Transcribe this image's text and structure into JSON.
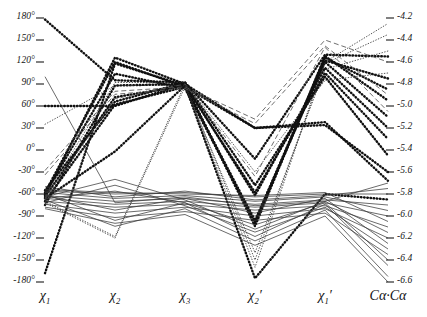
{
  "chart_data": {
    "type": "line",
    "subtype": "parallel-coordinates",
    "title": "",
    "xlabel": "",
    "ylabel": "",
    "grid": false,
    "legend": "none",
    "axes": [
      {
        "name": "chi1",
        "label": "χ",
        "sub": "1",
        "prime": false,
        "x": 45
      },
      {
        "name": "chi2",
        "label": "χ",
        "sub": "2",
        "prime": false,
        "x": 115
      },
      {
        "name": "chi3",
        "label": "χ",
        "sub": "3",
        "prime": false,
        "x": 185
      },
      {
        "name": "chi2p",
        "label": "χ",
        "sub": "2",
        "prime": true,
        "x": 255
      },
      {
        "name": "chi1p",
        "label": "χ",
        "sub": "1",
        "prime": true,
        "x": 325
      },
      {
        "name": "cacа",
        "label": "Cα·Cα",
        "sub": "",
        "prime": false,
        "x": 388
      }
    ],
    "left_axis": {
      "unit": "degrees",
      "min": -180,
      "max": 180,
      "step": 30,
      "ticks": [
        "180°",
        "150°",
        "120°",
        "90°",
        "60°",
        "30°",
        "0°",
        "-30°",
        "-60°",
        "-90°",
        "-120°",
        "-150°",
        "-180°"
      ],
      "tick_values": [
        180,
        150,
        120,
        90,
        60,
        30,
        0,
        -30,
        -60,
        -90,
        -120,
        -150,
        -180
      ]
    },
    "right_axis": {
      "unit": "angstrom",
      "min": -6.6,
      "max": -4.2,
      "step": 0.2,
      "ticks": [
        "-4.2",
        "-4.4",
        "-4.6",
        "-4.8",
        "-5.0",
        "-5.2",
        "-5.4",
        "-5.6",
        "-5.8",
        "-6.0",
        "-6.2",
        "-6.4",
        "-6.6"
      ],
      "tick_values": [
        -4.2,
        -4.4,
        -4.6,
        -4.8,
        -5.0,
        -5.2,
        -5.4,
        -5.6,
        -5.8,
        -6.0,
        -6.2,
        -6.4,
        -6.6
      ]
    },
    "xtick_labels": [
      "χ₁",
      "χ₂",
      "χ₃",
      "χ₂′",
      "χ₁′",
      "Cα·Cα"
    ],
    "styles": {
      "dotted": {
        "stroke": "#101010",
        "width": 2.4,
        "dash": "0.6,2.6",
        "cap": "round"
      },
      "solid": {
        "stroke": "#3a3a3a",
        "width": 0.75,
        "dash": "none",
        "cap": "butt"
      },
      "dashed": {
        "stroke": "#555555",
        "width": 0.85,
        "dash": "5,3",
        "cap": "butt"
      },
      "fine": {
        "stroke": "#2a2a2a",
        "width": 0.8,
        "dash": "0.6,2.2",
        "cap": "round"
      }
    },
    "series": [
      {
        "name": "d1",
        "style": "dotted",
        "values": [
          178,
          95,
          92,
          -12,
          130,
          -4.55
        ]
      },
      {
        "name": "d2",
        "style": "dotted",
        "values": [
          -168,
          118,
          88,
          -100,
          122,
          -4.75
        ]
      },
      {
        "name": "d3",
        "style": "dotted",
        "values": [
          -62,
          126,
          90,
          -104,
          128,
          -4.95
        ]
      },
      {
        "name": "d4",
        "style": "dotted",
        "values": [
          -58,
          120,
          86,
          -96,
          120,
          -5.1
        ]
      },
      {
        "name": "d5",
        "style": "dotted",
        "values": [
          -64,
          72,
          88,
          -58,
          105,
          -5.3
        ]
      },
      {
        "name": "d6",
        "style": "dotted",
        "values": [
          -55,
          66,
          92,
          -48,
          100,
          -5.45
        ]
      },
      {
        "name": "d7",
        "style": "dotted",
        "values": [
          60,
          60,
          90,
          30,
          34,
          -5.6
        ]
      },
      {
        "name": "d8",
        "style": "dotted",
        "values": [
          -70,
          62,
          86,
          30,
          38,
          -5.68
        ]
      },
      {
        "name": "d9",
        "style": "dotted",
        "values": [
          -66,
          -2,
          88,
          -175,
          -60,
          -5.85
        ]
      },
      {
        "name": "d10",
        "style": "dotted",
        "values": [
          -60,
          104,
          84,
          -98,
          126,
          -4.85
        ]
      },
      {
        "name": "d11",
        "style": "dotted",
        "values": [
          -75,
          88,
          90,
          -62,
          112,
          -5.2
        ]
      },
      {
        "name": "d12",
        "style": "fine",
        "values": [
          35,
          88,
          88,
          -160,
          120,
          -4.25
        ]
      },
      {
        "name": "d13",
        "style": "fine",
        "values": [
          -70,
          -118,
          90,
          -150,
          118,
          -4.35
        ]
      },
      {
        "name": "d14",
        "style": "fine",
        "values": [
          -72,
          -120,
          86,
          -140,
          110,
          -4.5
        ]
      },
      {
        "name": "d15",
        "style": "fine",
        "values": [
          -64,
          92,
          92,
          -30,
          95,
          -4.7
        ]
      },
      {
        "name": "d16",
        "style": "dashed",
        "values": [
          -28,
          80,
          86,
          42,
          150,
          -4.6
        ]
      },
      {
        "name": "d17",
        "style": "dashed",
        "values": [
          -34,
          76,
          84,
          36,
          142,
          -4.9
        ]
      },
      {
        "name": "d18",
        "style": "dashed",
        "values": [
          -66,
          70,
          90,
          -36,
          140,
          -5.05
        ]
      },
      {
        "name": "d19",
        "style": "solid",
        "values": [
          -62,
          -70,
          -66,
          -74,
          -68,
          -5.9
        ]
      },
      {
        "name": "d20",
        "style": "solid",
        "values": [
          -66,
          -74,
          -70,
          -78,
          -72,
          -6.0
        ]
      },
      {
        "name": "d21",
        "style": "solid",
        "values": [
          -70,
          -78,
          -74,
          -82,
          -76,
          -6.1
        ]
      },
      {
        "name": "d22",
        "style": "solid",
        "values": [
          -58,
          -66,
          -62,
          -70,
          -64,
          -5.95
        ]
      },
      {
        "name": "d23",
        "style": "solid",
        "values": [
          -74,
          -86,
          -78,
          -90,
          -80,
          -6.2
        ]
      },
      {
        "name": "d24",
        "style": "solid",
        "values": [
          -56,
          -60,
          -58,
          -64,
          -60,
          -5.8
        ]
      },
      {
        "name": "d25",
        "style": "solid",
        "values": [
          -78,
          -92,
          -84,
          -96,
          -86,
          -6.35
        ]
      },
      {
        "name": "d26",
        "style": "solid",
        "values": [
          -60,
          -96,
          -72,
          -118,
          -74,
          -6.45
        ]
      },
      {
        "name": "d27",
        "style": "solid",
        "values": [
          -68,
          -104,
          -80,
          -124,
          -82,
          -6.55
        ]
      },
      {
        "name": "d28",
        "style": "solid",
        "values": [
          -54,
          -58,
          -60,
          -62,
          -58,
          -6.05
        ]
      },
      {
        "name": "d29",
        "style": "solid",
        "values": [
          -64,
          -40,
          -68,
          -108,
          -70,
          -6.15
        ]
      },
      {
        "name": "d30",
        "style": "solid",
        "values": [
          -72,
          -48,
          -76,
          -112,
          -78,
          -6.3
        ]
      },
      {
        "name": "d31",
        "style": "solid",
        "values": [
          -50,
          -64,
          -56,
          -68,
          -62,
          -5.75
        ]
      },
      {
        "name": "d32",
        "style": "solid",
        "values": [
          -80,
          -100,
          -88,
          -130,
          -90,
          -6.6
        ]
      },
      {
        "name": "d33",
        "style": "solid",
        "values": [
          -62,
          -82,
          -66,
          -86,
          -66,
          -6.25
        ]
      },
      {
        "name": "d34",
        "style": "solid",
        "values": [
          -66,
          -56,
          -72,
          -102,
          -72,
          -6.4
        ]
      },
      {
        "name": "d35",
        "style": "solid",
        "values": [
          100,
          -72,
          -64,
          -76,
          -70,
          -5.7
        ]
      }
    ]
  }
}
